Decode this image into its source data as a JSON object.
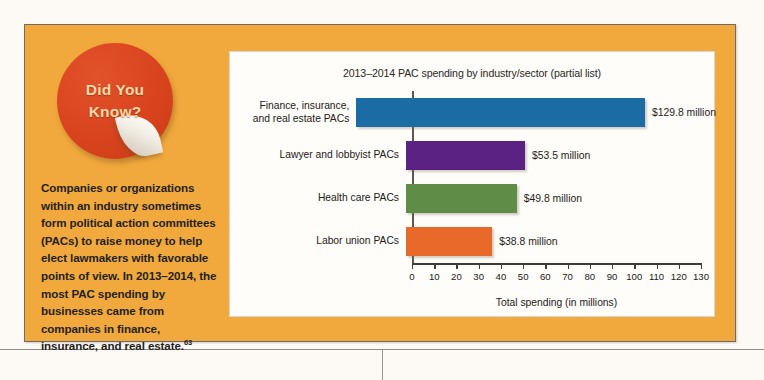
{
  "feature": {
    "badge": {
      "line1": "Did You",
      "line2": "Know?"
    },
    "body_text": "Companies or organizations within an industry sometimes form political action committees (PACs) to raise money to help elect lawmakers with favorable points of view. In 2013–2014, the most PAC spending by businesses came from companies in finance, insurance, and real estate.",
    "footnote_marker": "63",
    "panel_color": "#f1a93d",
    "badge_color": "#d8431d",
    "badge_text_color": "#fbd9a8"
  },
  "chart_data": {
    "type": "bar",
    "orientation": "horizontal",
    "title": "2013–2014 PAC spending by industry/sector (partial list)",
    "xlabel": "Total spending (in millions)",
    "ylabel": "",
    "xlim": [
      0,
      130
    ],
    "xticks": [
      0,
      10,
      20,
      30,
      40,
      50,
      60,
      70,
      80,
      90,
      100,
      110,
      120,
      130
    ],
    "xtick_labels": [
      "0",
      "10",
      "20",
      "30",
      "40",
      "50",
      "60",
      "70",
      "80",
      "90",
      "100",
      "110",
      "120",
      "130"
    ],
    "grid": false,
    "legend": "none",
    "categories": [
      "Finance, insurance,\nand real estate PACs",
      "Lawyer and lobbyist PACs",
      "Health care PACs",
      "Labor union PACs"
    ],
    "values": [
      129.8,
      53.5,
      49.8,
      38.8
    ],
    "value_labels": [
      "$129.8 million",
      "$53.5 million",
      "$49.8 million",
      "$38.8 million"
    ],
    "colors": [
      "#1b6ba5",
      "#5b2183",
      "#5f8c46",
      "#e8692a"
    ],
    "bars": [
      {
        "category_line1": "Finance, insurance,",
        "category_line2": "and real estate PACs",
        "value": 129.8,
        "value_label": "$129.8 million",
        "color": "#1b6ba5"
      },
      {
        "category_line1": "Lawyer and lobbyist PACs",
        "category_line2": "",
        "value": 53.5,
        "value_label": "$53.5 million",
        "color": "#5b2183"
      },
      {
        "category_line1": "Health care PACs",
        "category_line2": "",
        "value": 49.8,
        "value_label": "$49.8 million",
        "color": "#5f8c46"
      },
      {
        "category_line1": "Labor union PACs",
        "category_line2": "",
        "value": 38.8,
        "value_label": "$38.8 million",
        "color": "#e8692a"
      }
    ]
  }
}
